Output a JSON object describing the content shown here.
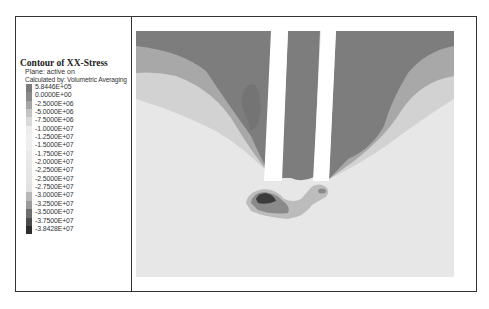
{
  "legend": {
    "title": "Contour of XX-Stress",
    "plane": "Plane: active on",
    "calculated": "Calculated by: Volumetric Averaging",
    "levels": [
      {
        "label": "5.8446E+05",
        "color": "#7a7a7a"
      },
      {
        "label": "0.0000E+00",
        "color": "#8a8a8a"
      },
      {
        "label": "-2.5000E+06",
        "color": "#a5a5a5"
      },
      {
        "label": "-5.0000E+06",
        "color": "#c4c4c4"
      },
      {
        "label": "-7.5000E+06",
        "color": "#dadada"
      },
      {
        "label": "-1.0000E+07",
        "color": "#ececec"
      },
      {
        "label": "-1.2500E+07",
        "color": "#f0f0f0"
      },
      {
        "label": "-1.5000E+07",
        "color": "#eeeeee"
      },
      {
        "label": "-1.7500E+07",
        "color": "#eaeaea"
      },
      {
        "label": "-2.0000E+07",
        "color": "#e8e8e8"
      },
      {
        "label": "-2.2500E+07",
        "color": "#e6e6e6"
      },
      {
        "label": "-2.5000E+07",
        "color": "#e4e4e4"
      },
      {
        "label": "-2.7500E+07",
        "color": "#e2e2e2"
      },
      {
        "label": "-3.0000E+07",
        "color": "#b8b8b8"
      },
      {
        "label": "-3.2500E+07",
        "color": "#9a9a9a"
      },
      {
        "label": "-3.5000E+07",
        "color": "#6e6e6e"
      },
      {
        "label": "-3.7500E+07",
        "color": "#4a4a4a"
      },
      {
        "label": "-3.8428E+07",
        "color": "#2e2e2e"
      }
    ]
  },
  "plot": {
    "quantity": "XX-Stress",
    "colors": {
      "high": "#7d7d7d",
      "mid1": "#a3a3a3",
      "mid2": "#cfcfcf",
      "background": "#e6e6e6",
      "slot": "#ffffff",
      "low1": "#b5b5b5",
      "low2": "#7a7a7a",
      "low3": "#3c3c3c"
    }
  }
}
